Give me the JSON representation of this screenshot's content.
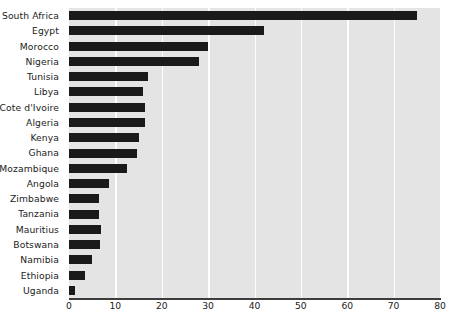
{
  "chart_data": {
    "type": "bar",
    "orientation": "horizontal",
    "title": "",
    "subtitle": "",
    "xlabel": "",
    "ylabel": "",
    "xlim": [
      0,
      80
    ],
    "ylim": null,
    "grid": true,
    "grid_axis": "x",
    "legend": false,
    "legend_position": "none",
    "categories": [
      "South Africa",
      "Egypt",
      "Morocco",
      "Nigeria",
      "Tunisia",
      "Libya",
      "Cote d'Ivoire",
      "Algeria",
      "Kenya",
      "Ghana",
      "Mozambique",
      "Angola",
      "Zimbabwe",
      "Tanzania",
      "Mauritius",
      "Botswana",
      "Namibia",
      "Ethiopia",
      "Uganda"
    ],
    "values": [
      75,
      42,
      30,
      28,
      17,
      16,
      16.3,
      16.3,
      15,
      14.6,
      12.5,
      8.7,
      6.5,
      6.5,
      7,
      6.7,
      5,
      3.5,
      1.3
    ],
    "xticks": [
      0,
      10,
      20,
      30,
      40,
      50,
      60,
      70,
      80
    ],
    "xtick_labels": [
      "0",
      "10",
      "20",
      "30",
      "40",
      "50",
      "60",
      "70",
      "80"
    ]
  },
  "style": {
    "bar_color": "#1a1a1a",
    "plot_background": "#e4e4e4",
    "gridline_color": "#fdfdfd",
    "axis_color": "#3d3d3d",
    "text_color": "#1b1b1b",
    "page_background": "#ffffff"
  }
}
